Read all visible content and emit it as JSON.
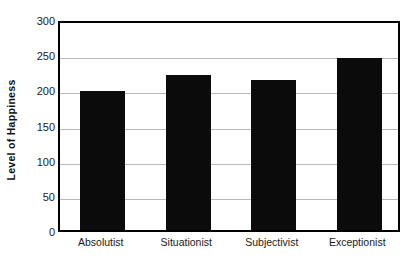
{
  "chart_data": {
    "type": "bar",
    "title": "",
    "xlabel": "",
    "ylabel": "Level of Happiness",
    "categories": [
      "Absolutist",
      "Situationist",
      "Subjectivist",
      "Exceptionist"
    ],
    "values": [
      197,
      220,
      213,
      245
    ],
    "ylim": [
      0,
      300
    ],
    "yticks": [
      0,
      50,
      100,
      150,
      200,
      250,
      300
    ],
    "ytick_labels": [
      "0",
      "50",
      "100",
      "150",
      "200",
      "250",
      "300"
    ],
    "grid": "horizontal",
    "legend": "none",
    "bar_color": "#0b0b0b",
    "frame_color": "#000000",
    "gridline_color": "#b9b9b9",
    "background_color": "#ffffff"
  }
}
